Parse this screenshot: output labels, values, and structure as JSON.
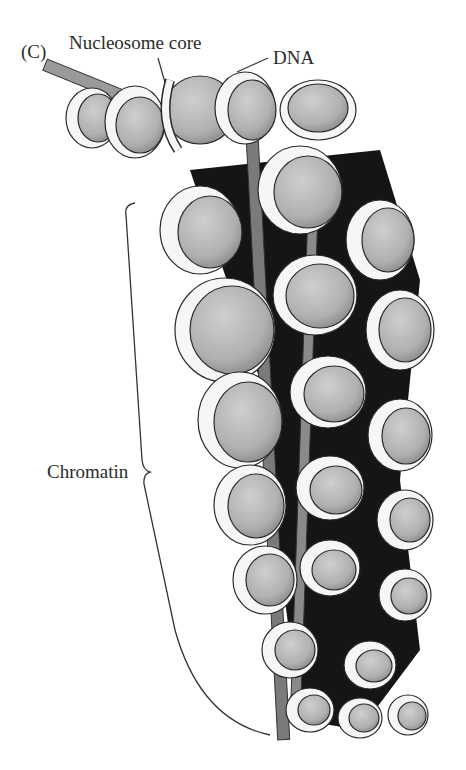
{
  "figure": {
    "panel_label": "(C)",
    "labels": {
      "nucleosome_core": "Nucleosome core",
      "dna": "DNA",
      "chromatin": "Chromatin"
    },
    "colors": {
      "background": "#ffffff",
      "nucleosome_fill": "#b8b8b8",
      "dna_fill": "#f4f4f4",
      "linker_shadow": "#111111",
      "outline": "#2a2a2a"
    }
  }
}
